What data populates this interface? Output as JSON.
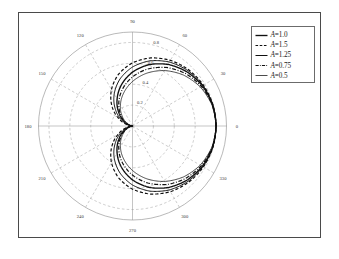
{
  "figure": {
    "background_color": "#ffffff",
    "frame_color": "#4a4a4a",
    "grid_color": "#9a9a9a",
    "axis_color": "#8a8a8a",
    "curve_color": "#101010"
  },
  "legend": {
    "position": "top-right",
    "entries": [
      {
        "label": "A=1.0",
        "var": "A",
        "value_text": "=1.0",
        "A": 1.0,
        "style": "solid",
        "width": 1.35
      },
      {
        "label": "A=1.5",
        "var": "A",
        "value_text": "=1.5",
        "A": 1.5,
        "style": "dashed",
        "width": 1.2
      },
      {
        "label": "A=1.25",
        "var": "A",
        "value_text": "=1.25",
        "A": 1.25,
        "style": "solid",
        "width": 1.0
      },
      {
        "label": "A=0.75",
        "var": "A",
        "value_text": "=0.75",
        "A": 0.75,
        "style": "dashdot",
        "width": 1.2
      },
      {
        "label": "A=0.5",
        "var": "A",
        "value_text": "=0.5",
        "A": 0.5,
        "style": "solid",
        "width": 0.75
      }
    ]
  },
  "chart_data": {
    "type": "line",
    "projection": "polar",
    "title": "",
    "xlabel": "",
    "ylabel": "",
    "grid": true,
    "legend_position": "top-right",
    "angle_unit": "degrees",
    "angle_direction": "counterclockwise",
    "angle_zero_location": "E",
    "angular_ticks": [
      0,
      30,
      60,
      90,
      120,
      150,
      180,
      210,
      240,
      270,
      300,
      330
    ],
    "angular_tick_labels": [
      "0",
      "30",
      "60",
      "90",
      "120",
      "150",
      "180",
      "210",
      "240",
      "270",
      "300",
      "330"
    ],
    "radial_ticks": [
      0.2,
      0.4,
      0.6,
      0.8
    ],
    "radial_tick_labels": [
      "0.2",
      "0.4",
      "0.6",
      "0.8"
    ],
    "radial_tick_angle": 75,
    "rlim": [
      0,
      0.9
    ],
    "rmax": 0.9,
    "series": [
      {
        "name": "A=1.0",
        "A": 1.0,
        "style": "solid",
        "formula": "r = 0.8 * (1 + cos(theta)) / (1 + A_factor)",
        "theta": [
          0,
          15,
          30,
          45,
          60,
          75,
          90,
          105,
          120,
          135,
          150,
          165,
          180,
          195,
          210,
          225,
          240,
          255,
          270,
          285,
          300,
          315,
          330,
          345,
          360
        ],
        "r": [
          0.8,
          0.793,
          0.772,
          0.735,
          0.681,
          0.608,
          0.516,
          0.409,
          0.295,
          0.187,
          0.098,
          0.032,
          0.0,
          0.032,
          0.098,
          0.187,
          0.295,
          0.409,
          0.516,
          0.608,
          0.681,
          0.735,
          0.772,
          0.793,
          0.8
        ]
      },
      {
        "name": "A=1.5",
        "A": 1.5,
        "style": "dashed",
        "theta": [
          0,
          15,
          30,
          45,
          60,
          75,
          90,
          105,
          120,
          135,
          150,
          165,
          180,
          195,
          210,
          225,
          240,
          255,
          270,
          285,
          300,
          315,
          330,
          345,
          360
        ],
        "r": [
          0.8,
          0.796,
          0.784,
          0.761,
          0.726,
          0.675,
          0.605,
          0.514,
          0.403,
          0.281,
          0.16,
          0.056,
          0.0,
          0.056,
          0.16,
          0.281,
          0.403,
          0.514,
          0.605,
          0.675,
          0.726,
          0.761,
          0.784,
          0.796,
          0.8
        ]
      },
      {
        "name": "A=1.25",
        "A": 1.25,
        "style": "solid",
        "theta": [
          0,
          15,
          30,
          45,
          60,
          75,
          90,
          105,
          120,
          135,
          150,
          165,
          180,
          195,
          210,
          225,
          240,
          255,
          270,
          285,
          300,
          315,
          330,
          345,
          360
        ],
        "r": [
          0.8,
          0.795,
          0.779,
          0.75,
          0.707,
          0.646,
          0.565,
          0.465,
          0.351,
          0.234,
          0.127,
          0.043,
          0.0,
          0.043,
          0.127,
          0.234,
          0.351,
          0.465,
          0.565,
          0.646,
          0.707,
          0.75,
          0.779,
          0.795,
          0.8
        ]
      },
      {
        "name": "A=0.75",
        "A": 0.75,
        "style": "dashdot",
        "theta": [
          0,
          15,
          30,
          45,
          60,
          75,
          90,
          105,
          120,
          135,
          150,
          165,
          180,
          195,
          210,
          225,
          240,
          255,
          270,
          285,
          300,
          315,
          330,
          345,
          360
        ],
        "r": [
          0.8,
          0.79,
          0.761,
          0.713,
          0.647,
          0.565,
          0.47,
          0.367,
          0.262,
          0.163,
          0.081,
          0.024,
          0.0,
          0.024,
          0.081,
          0.163,
          0.262,
          0.367,
          0.47,
          0.565,
          0.647,
          0.713,
          0.761,
          0.79,
          0.8
        ]
      },
      {
        "name": "A=0.5",
        "A": 0.5,
        "style": "solid",
        "theta": [
          0,
          15,
          30,
          45,
          60,
          75,
          90,
          105,
          120,
          135,
          150,
          165,
          180,
          195,
          210,
          225,
          240,
          255,
          270,
          285,
          300,
          315,
          330,
          345,
          360
        ],
        "r": [
          0.8,
          0.787,
          0.749,
          0.69,
          0.613,
          0.523,
          0.426,
          0.327,
          0.231,
          0.143,
          0.07,
          0.019,
          0.0,
          0.019,
          0.07,
          0.143,
          0.231,
          0.327,
          0.426,
          0.523,
          0.613,
          0.69,
          0.749,
          0.787,
          0.8
        ]
      }
    ]
  }
}
